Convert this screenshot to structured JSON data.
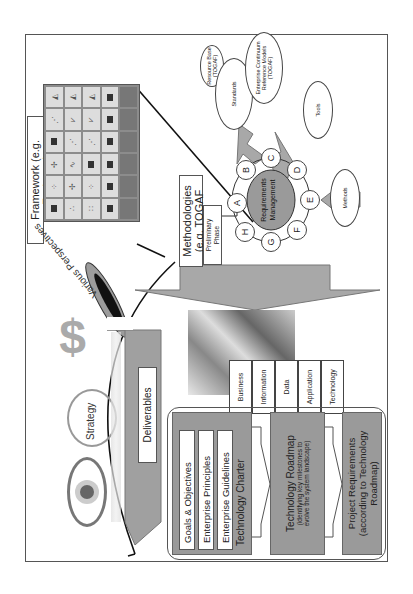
{
  "framework": {
    "label": "Framework (e.g. Zachman)",
    "perspectives_label": "Various Perspectives",
    "grid": {
      "rows": 5,
      "cols": 6
    }
  },
  "methodologies": {
    "label_line1": "Methodologies",
    "label_line2": "(e.g. TOGAF ADM)",
    "preliminary_line1": "Preliminary",
    "preliminary_line2": "Phase",
    "center_line1": "Requirements",
    "center_line2": "Management",
    "phases": [
      "A",
      "B",
      "C",
      "D",
      "E",
      "F",
      "G",
      "H"
    ]
  },
  "inputs": {
    "resource_base": [
      "Resource Base",
      "(TOGAF)"
    ],
    "standards": [
      "Standards"
    ],
    "enterprise_continuum": [
      "Enterprise Continuum",
      "Reference Models",
      "(TOGAF)"
    ],
    "tools": [
      "Tools"
    ],
    "methods": [
      "Methods"
    ]
  },
  "strategy": {
    "label": "Strategy",
    "icons": [
      "eye-icon",
      "magnifier-icon",
      "dollar-icon"
    ]
  },
  "deliverables": {
    "label": "Deliverables"
  },
  "architecture_tabs": [
    "Business",
    "Information",
    "Data",
    "Application",
    "Technology"
  ],
  "outputs": {
    "charter": {
      "items": [
        "Goals & Objectives",
        "Enterprise Principles",
        "Enterprise Guidelines"
      ],
      "title": "Technology Charter"
    },
    "roadmap": {
      "title": "Technology Roadmap",
      "subtitle_line1": "(identifying key milestones to",
      "subtitle_line2": "evolve the system landscape)"
    },
    "project": {
      "line1": "Project Requirements",
      "line2": "(according to Technology",
      "line3": "Roadmap)"
    }
  },
  "colors": {
    "gray_fill": "#9a9a9a",
    "arrow_fill": "#a8a8a8",
    "border": "#555555"
  }
}
